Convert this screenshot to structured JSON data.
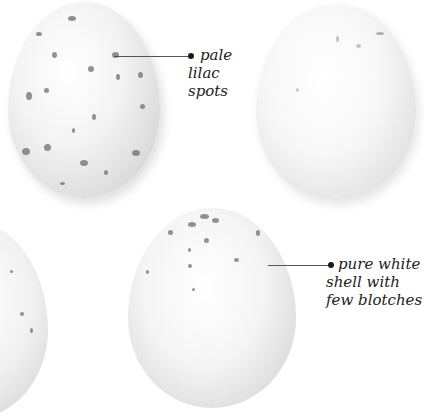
{
  "annotations": [
    {
      "id": "pale-lilac-spots",
      "lines": [
        "pale",
        "lilac",
        "spots"
      ]
    },
    {
      "id": "pure-white-shell",
      "lines": [
        "pure white",
        "shell with",
        "few blotches"
      ]
    }
  ],
  "colors": {
    "background": "#ffffff",
    "text": "#222222",
    "leader": "#555555",
    "spot": "#6e6e6e"
  }
}
